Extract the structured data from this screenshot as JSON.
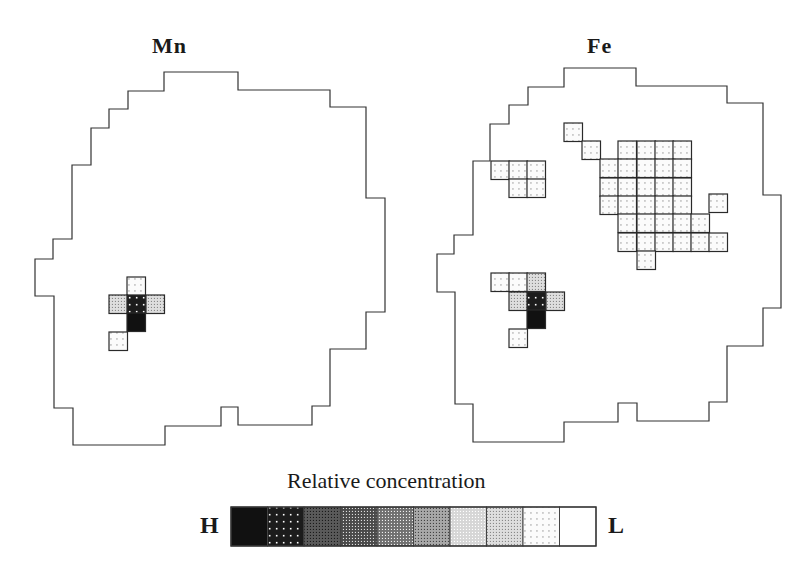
{
  "figure": {
    "panels": [
      {
        "title": "Mn",
        "title_pos": [
          152,
          54
        ],
        "outline": [
          [
            164,
            72
          ],
          [
            238,
            72
          ],
          [
            238,
            90
          ],
          [
            330,
            90
          ],
          [
            330,
            107
          ],
          [
            366,
            107
          ],
          [
            366,
            198
          ],
          [
            385,
            198
          ],
          [
            385,
            312
          ],
          [
            366,
            312
          ],
          [
            366,
            349
          ],
          [
            330,
            349
          ],
          [
            330,
            406
          ],
          [
            312,
            406
          ],
          [
            312,
            425
          ],
          [
            238,
            425
          ],
          [
            238,
            407
          ],
          [
            221,
            407
          ],
          [
            221,
            426
          ],
          [
            165,
            426
          ],
          [
            165,
            445
          ],
          [
            73,
            445
          ],
          [
            73,
            408
          ],
          [
            54,
            408
          ],
          [
            54,
            296
          ],
          [
            35,
            296
          ],
          [
            35,
            259
          ],
          [
            53,
            259
          ],
          [
            53,
            239
          ],
          [
            72,
            239
          ],
          [
            72,
            165
          ],
          [
            91,
            165
          ],
          [
            91,
            128
          ],
          [
            109,
            128
          ],
          [
            109,
            109
          ],
          [
            128,
            109
          ],
          [
            128,
            91
          ],
          [
            164,
            91
          ]
        ],
        "cells": [
          {
            "x": 127,
            "y": 277,
            "level": 8
          },
          {
            "x": 109,
            "y": 295,
            "level": 7
          },
          {
            "x": 127,
            "y": 295,
            "level": 1
          },
          {
            "x": 146,
            "y": 295,
            "level": 7
          },
          {
            "x": 127,
            "y": 313,
            "level": 0
          },
          {
            "x": 109,
            "y": 332,
            "level": 8
          }
        ]
      },
      {
        "title": "Fe",
        "title_pos": [
          587,
          54
        ],
        "outline": [
          [
            564,
            68
          ],
          [
            636,
            68
          ],
          [
            636,
            86
          ],
          [
            727,
            86
          ],
          [
            727,
            103
          ],
          [
            763,
            103
          ],
          [
            763,
            195
          ],
          [
            781,
            195
          ],
          [
            781,
            308
          ],
          [
            763,
            308
          ],
          [
            763,
            346
          ],
          [
            727,
            346
          ],
          [
            727,
            402
          ],
          [
            709,
            402
          ],
          [
            709,
            421
          ],
          [
            637,
            421
          ],
          [
            637,
            403
          ],
          [
            618,
            403
          ],
          [
            618,
            422
          ],
          [
            564,
            422
          ],
          [
            564,
            442
          ],
          [
            473,
            442
          ],
          [
            473,
            404
          ],
          [
            455,
            404
          ],
          [
            455,
            292
          ],
          [
            437,
            292
          ],
          [
            437,
            254
          ],
          [
            454,
            254
          ],
          [
            454,
            235
          ],
          [
            473,
            235
          ],
          [
            473,
            161
          ],
          [
            490,
            161
          ],
          [
            490,
            124
          ],
          [
            509,
            124
          ],
          [
            509,
            105
          ],
          [
            528,
            105
          ],
          [
            528,
            87
          ],
          [
            564,
            87
          ]
        ],
        "cells": [
          {
            "x": 491,
            "y": 161,
            "level": 8
          },
          {
            "x": 509,
            "y": 161,
            "level": 8
          },
          {
            "x": 527,
            "y": 161,
            "level": 8
          },
          {
            "x": 509,
            "y": 179,
            "level": 8
          },
          {
            "x": 527,
            "y": 179,
            "level": 8
          },
          {
            "x": 564,
            "y": 123,
            "level": 8
          },
          {
            "x": 582,
            "y": 141,
            "level": 8
          },
          {
            "x": 618,
            "y": 141,
            "level": 8
          },
          {
            "x": 637,
            "y": 141,
            "level": 8
          },
          {
            "x": 655,
            "y": 141,
            "level": 8
          },
          {
            "x": 673,
            "y": 141,
            "level": 8
          },
          {
            "x": 600,
            "y": 159,
            "level": 8
          },
          {
            "x": 618,
            "y": 159,
            "level": 8
          },
          {
            "x": 637,
            "y": 159,
            "level": 8
          },
          {
            "x": 655,
            "y": 159,
            "level": 8
          },
          {
            "x": 673,
            "y": 159,
            "level": 8
          },
          {
            "x": 600,
            "y": 178,
            "level": 8
          },
          {
            "x": 618,
            "y": 178,
            "level": 8
          },
          {
            "x": 637,
            "y": 178,
            "level": 8
          },
          {
            "x": 655,
            "y": 178,
            "level": 8
          },
          {
            "x": 673,
            "y": 178,
            "level": 8
          },
          {
            "x": 600,
            "y": 196,
            "level": 8
          },
          {
            "x": 618,
            "y": 196,
            "level": 8
          },
          {
            "x": 637,
            "y": 196,
            "level": 8
          },
          {
            "x": 655,
            "y": 196,
            "level": 8
          },
          {
            "x": 673,
            "y": 196,
            "level": 8
          },
          {
            "x": 709,
            "y": 194,
            "level": 8
          },
          {
            "x": 618,
            "y": 214,
            "level": 8
          },
          {
            "x": 637,
            "y": 214,
            "level": 8
          },
          {
            "x": 655,
            "y": 214,
            "level": 8
          },
          {
            "x": 673,
            "y": 214,
            "level": 8
          },
          {
            "x": 691,
            "y": 214,
            "level": 8
          },
          {
            "x": 618,
            "y": 233,
            "level": 8
          },
          {
            "x": 637,
            "y": 233,
            "level": 8
          },
          {
            "x": 655,
            "y": 233,
            "level": 8
          },
          {
            "x": 673,
            "y": 233,
            "level": 8
          },
          {
            "x": 691,
            "y": 233,
            "level": 8
          },
          {
            "x": 709,
            "y": 233,
            "level": 8
          },
          {
            "x": 637,
            "y": 251,
            "level": 8
          },
          {
            "x": 491,
            "y": 273,
            "level": 8
          },
          {
            "x": 509,
            "y": 273,
            "level": 8
          },
          {
            "x": 527,
            "y": 273,
            "level": 7
          },
          {
            "x": 509,
            "y": 292,
            "level": 7
          },
          {
            "x": 527,
            "y": 292,
            "level": 1
          },
          {
            "x": 546,
            "y": 292,
            "level": 7
          },
          {
            "x": 527,
            "y": 310,
            "level": 0
          },
          {
            "x": 509,
            "y": 329,
            "level": 8
          }
        ]
      }
    ],
    "cell_size": 18.5,
    "legend": {
      "title": "Relative concentration",
      "high_label": "H",
      "low_label": "L",
      "x": 231,
      "y": 507,
      "width": 365,
      "height": 39,
      "levels": [
        {
          "fill": "#111111",
          "dot": null
        },
        {
          "fill": "#1c1c1c",
          "dot": "#ffffff"
        },
        {
          "fill": "#5a5a5a",
          "dot": "#1a1a1a"
        },
        {
          "fill": "#4a4a4a",
          "dot": "#dddddd"
        },
        {
          "fill": "#707070",
          "dot": "#f0f0f0"
        },
        {
          "fill": "#a8a8a8",
          "dot": "#444444"
        },
        {
          "fill": "#d6d6d6",
          "dot": "#ffffff"
        },
        {
          "fill": "#dedede",
          "dot": "#888888"
        },
        {
          "fill": "#fbfbfb",
          "dot": "#777777"
        },
        {
          "fill": "#ffffff",
          "dot": null
        }
      ]
    },
    "colors": {
      "line": "#333333",
      "text": "#1a1a1a"
    }
  }
}
